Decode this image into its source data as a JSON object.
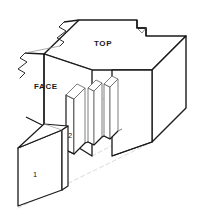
{
  "drawing": {
    "kind": "isometric-technical-illustration",
    "subject": "box / finger joint on a rectangular beam",
    "background_color": "#ffffff",
    "labels": {
      "top": "TOP",
      "face": "FACE",
      "part_one": "1",
      "part_two": "2"
    },
    "styles": {
      "outline_color": "#1a1a1a",
      "outline_width": 1.5,
      "thin_color": "#5a5a5a",
      "thin_width": 0.7,
      "hidden_color": "#c2c2c2",
      "hidden_width": 0.7,
      "hidden_dash": "4 3",
      "fill_color": "#ffffff",
      "text_color": "#1a1a1a"
    },
    "geometry": {
      "beam_top_face": "M 44,54 L 79,20 L 138,20 L 138,28 L 146,28 L 146,35 L 185,35 L 150,70 L 92,70 Z",
      "beam_front_face": "M 44,54 L 44,126 L 92,156 L 92,70 Z",
      "beam_right_face": "M 150,70 L 185,35 L 185,107 L 150,142 Z",
      "beam_front_lower": "M 92,70 L 150,70 L 150,142 L 92,156 Z",
      "break_line_upper": "M 57,47 L 62,42 L 56,38 L 64,31 L 58,27 L 62,23",
      "break_line_lower": "M 20,76 L 25,71 L 19,67 L 27,60 L 21,56 L 25,52",
      "step_notch": "M 138,20 L 138,28 L 146,28 L 146,35",
      "fin_a_path": "M 66,92 L 74,84 L 78,84 L 78,138 L 74,146 L 66,146 Z",
      "fin_b_path": "M 84,86 L 92,78 L 96,78 L 96,134 L 92,142 L 84,142 Z",
      "fin_c_path": "M 100,84 L 108,76 L 112,76 L 112,130 L 108,138 L 100,138 Z",
      "plate_one_front": "M 20,144 L 20,206 L 62,190 L 62,126 Z",
      "plate_one_top": "M 20,144 L 44,122 L 68,122 L 62,126 Z",
      "plate_one_side": "M 62,126 L 68,122 L 68,186 L 62,190 Z",
      "hidden_edges": [
        "M 44,126 L 92,156",
        "M 92,156 L 150,142",
        "M 44,126 L 92,98 L 185,107",
        "M 92,70 L 92,98",
        "M 20,206 L 150,142",
        "M 92,156 L 185,107"
      ]
    }
  }
}
